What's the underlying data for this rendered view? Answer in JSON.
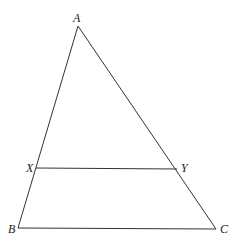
{
  "diagram": {
    "points": {
      "A": {
        "label": "A",
        "x": 78,
        "y": 26
      },
      "B": {
        "label": "B",
        "x": 18,
        "y": 228
      },
      "C": {
        "label": "C",
        "x": 216,
        "y": 229
      },
      "X": {
        "label": "X",
        "x": 36,
        "y": 168
      },
      "Y": {
        "label": "Y",
        "x": 177,
        "y": 169
      }
    },
    "segments": [
      "AB",
      "AC",
      "BC",
      "XY"
    ],
    "line_color": "#333333"
  }
}
